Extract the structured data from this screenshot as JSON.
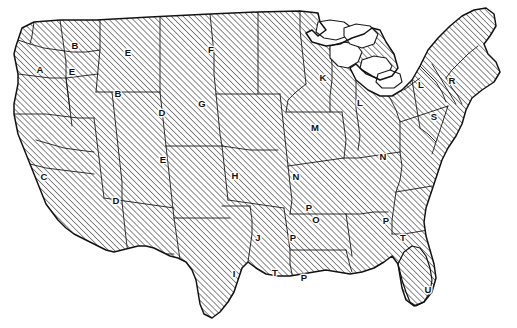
{
  "figure": {
    "width": 517,
    "height": 328,
    "background_color": "#ffffff",
    "line_color": "#1a1a1a",
    "hatch_color": "#2b2b2b",
    "hatch_angle_degrees": 45,
    "hatch_spacing_px": 3,
    "lakes_fill": "#ffffff"
  },
  "labels": [
    {
      "text": "A",
      "x": 40,
      "y": 70
    },
    {
      "text": "B",
      "x": 75,
      "y": 46
    },
    {
      "text": "E",
      "x": 72,
      "y": 72
    },
    {
      "text": "E",
      "x": 128,
      "y": 53
    },
    {
      "text": "B",
      "x": 118,
      "y": 94
    },
    {
      "text": "F",
      "x": 211,
      "y": 50
    },
    {
      "text": "D",
      "x": 162,
      "y": 113
    },
    {
      "text": "G",
      "x": 202,
      "y": 104
    },
    {
      "text": "C",
      "x": 44,
      "y": 177
    },
    {
      "text": "E",
      "x": 163,
      "y": 160
    },
    {
      "text": "D",
      "x": 116,
      "y": 201
    },
    {
      "text": "H",
      "x": 235,
      "y": 176
    },
    {
      "text": "K",
      "x": 323,
      "y": 78
    },
    {
      "text": "L",
      "x": 360,
      "y": 103
    },
    {
      "text": "M",
      "x": 315,
      "y": 128
    },
    {
      "text": "L",
      "x": 421,
      "y": 85
    },
    {
      "text": "R",
      "x": 452,
      "y": 81
    },
    {
      "text": "S",
      "x": 434,
      "y": 117
    },
    {
      "text": "N",
      "x": 383,
      "y": 157
    },
    {
      "text": "N",
      "x": 296,
      "y": 177
    },
    {
      "text": "J",
      "x": 258,
      "y": 238
    },
    {
      "text": "P",
      "x": 293,
      "y": 238
    },
    {
      "text": "P",
      "x": 309,
      "y": 208
    },
    {
      "text": "O",
      "x": 316,
      "y": 220
    },
    {
      "text": "I",
      "x": 234,
      "y": 274
    },
    {
      "text": "T",
      "x": 275,
      "y": 273
    },
    {
      "text": "P",
      "x": 304,
      "y": 278
    },
    {
      "text": "P",
      "x": 386,
      "y": 221
    },
    {
      "text": "T",
      "x": 403,
      "y": 238
    },
    {
      "text": "U",
      "x": 428,
      "y": 290
    }
  ],
  "geometry": {
    "nation_outline": "M 18 40 L 22 28 L 34 22 L 60 20 L 96 20 L 150 17 L 210 14 L 258 12 L 300 11 L 318 13 L 320 22 L 326 30 L 318 36 L 312 30 L 306 33 L 312 42 L 326 46 L 340 44 L 352 38 L 364 34 L 372 28 L 380 30 L 386 42 L 394 54 L 398 68 L 392 76 L 380 80 L 372 76 L 362 70 L 356 64 L 350 68 L 356 80 L 368 90 L 380 96 L 392 96 L 402 90 L 412 80 L 420 66 L 428 50 L 438 38 L 450 26 L 462 16 L 474 10 L 486 8 L 494 14 L 496 26 L 490 36 L 484 44 L 488 54 L 496 62 L 500 72 L 494 82 L 482 90 L 472 98 L 466 110 L 462 124 L 456 136 L 448 148 L 442 160 L 438 172 L 434 184 L 430 196 L 426 208 L 424 222 L 426 236 L 430 250 L 434 264 L 436 278 L 432 292 L 424 302 L 414 306 L 406 300 L 402 288 L 400 276 L 398 264 L 392 256 L 384 262 L 374 268 L 362 272 L 350 274 L 338 272 L 326 270 L 314 272 L 302 274 L 290 276 L 278 276 L 266 274 L 256 268 L 248 262 L 242 268 L 238 280 L 234 292 L 228 302 L 220 312 L 212 318 L 204 314 L 200 304 L 198 292 L 196 280 L 192 270 L 186 262 L 178 258 L 170 256 L 162 252 L 154 248 L 146 246 L 138 246 L 130 248 L 122 250 L 114 252 L 106 250 L 98 246 L 90 242 L 82 238 L 74 234 L 66 228 L 58 220 L 52 212 L 46 204 L 42 194 L 38 184 L 34 174 L 30 164 L 26 154 L 22 144 L 18 134 L 16 124 L 14 114 L 14 104 L 16 94 L 18 84 L 18 74 L 16 64 L 14 54 L 16 46 Z",
    "florida_outline": "M 398 264 L 404 252 L 412 246 L 420 248 L 426 256 L 430 268 L 432 280 L 430 292 L 424 302 L 416 306 L 410 302 L 406 292 L 402 280 Z",
    "lakes": [
      "M 318 22 L 330 20 L 344 22 L 352 28 L 348 36 L 336 40 L 324 38 L 316 32 Z",
      "M 330 46 L 344 42 L 356 44 L 362 52 L 358 62 L 348 68 L 338 66 L 330 58 Z",
      "M 344 28 L 356 24 L 370 26 L 378 34 L 374 44 L 362 48 L 350 44 L 344 36 Z",
      "M 362 60 L 374 56 L 386 58 L 392 66 L 388 74 L 376 78 L 366 74 L 360 68 Z",
      "M 378 74 L 390 70 L 400 74 L 402 82 L 394 88 L 382 88 L 376 82 Z"
    ],
    "state_borders": [
      "M 18 40 L 30 44 L 44 48 L 58 50 L 72 52 L 86 52 L 100 50",
      "M 100 20 L 100 50 L 98 70 L 96 92",
      "M 60 20 L 62 34 L 64 48 L 66 62",
      "M 18 74 L 34 76 L 50 78 L 66 78 L 82 76 L 98 74",
      "M 96 92 L 112 92 L 128 92 L 144 92 L 160 92",
      "M 66 62 L 66 78 L 68 94 L 70 110 L 72 126",
      "M 14 114 L 30 114 L 46 114 L 62 116 L 78 118 L 94 118",
      "M 94 118 L 96 134 L 98 150 L 100 166 L 102 182 L 104 198",
      "M 36 140 L 50 144 L 64 148 L 78 150 L 94 152",
      "M 30 164 L 46 168 L 62 170 L 78 172 L 94 174",
      "M 104 198 L 118 200 L 132 202 L 146 204 L 160 206 L 174 208",
      "M 160 17 L 160 34 L 160 52 L 160 72 L 160 92",
      "M 160 92 L 162 110 L 164 128 L 166 146",
      "M 112 92 L 114 110 L 116 128 L 118 146 L 120 164 L 122 182 L 122 202",
      "M 122 202 L 124 220 L 126 238 L 128 254",
      "M 166 146 L 180 146 L 194 146 L 208 146 L 222 146",
      "M 166 146 L 168 164 L 170 182 L 172 200 L 174 218",
      "M 210 14 L 212 34 L 214 54 L 214 74 L 216 94",
      "M 216 94 L 218 114 L 220 134 L 222 146",
      "M 216 94 L 232 94 L 248 94 L 264 94 L 280 94",
      "M 258 12 L 258 34 L 258 56 L 258 76 L 258 94",
      "M 222 146 L 224 164 L 226 182 L 228 200",
      "M 174 218 L 188 218 L 202 218 L 216 218 L 230 218",
      "M 222 146 L 236 148 L 250 150 L 264 150 L 278 150",
      "M 228 200 L 242 202 L 256 204 L 270 206 L 284 208",
      "M 280 94 L 282 112 L 284 130 L 286 148 L 288 166",
      "M 288 166 L 290 184 L 292 200 L 290 214",
      "M 288 166 L 302 164 L 316 162 L 330 160 L 344 158",
      "M 300 11 L 300 30 L 302 48 L 304 66 L 306 84",
      "M 306 84 L 296 92 L 288 100 L 286 112",
      "M 286 112 L 300 112 L 314 112 L 328 112 L 342 112",
      "M 330 48 L 332 64 L 332 80 L 330 96 L 330 112",
      "M 342 112 L 344 126 L 346 140 L 344 158",
      "M 344 158 L 358 158 L 372 156 L 386 154 L 400 152",
      "M 356 80 L 356 94 L 356 108 L 358 122 L 360 136 L 358 150",
      "M 400 152 L 402 166 L 400 180 L 396 192",
      "M 382 88 L 390 98 L 396 110 L 400 122 L 400 138 L 400 152",
      "M 400 122 L 412 118 L 424 114 L 436 110 L 448 106",
      "M 412 80 L 414 92 L 416 104 L 418 116 L 420 128",
      "M 432 64 L 438 74 L 444 84 L 450 94 L 456 104",
      "M 448 106 L 444 118 L 440 130 L 436 142 L 432 154",
      "M 420 128 L 428 134 L 436 142",
      "M 396 192 L 408 190 L 420 188 L 432 186",
      "M 396 192 L 394 206 L 392 220 L 392 234",
      "M 392 234 L 404 234 L 416 232 L 428 230",
      "M 290 214 L 304 214 L 318 214 L 332 214 L 346 214",
      "M 346 214 L 348 228 L 350 242 L 352 256",
      "M 346 214 L 360 214 L 374 212 L 388 212",
      "M 284 208 L 286 222 L 288 236 L 290 250 L 290 264",
      "M 290 250 L 304 250 L 318 250 L 332 250 L 346 250",
      "M 346 250 L 348 258 L 350 266 L 352 272",
      "M 248 262 L 250 248 L 252 234 L 252 220 L 250 206",
      "M 250 206 L 236 206 L 222 206",
      "M 290 264 L 292 274 L 292 276",
      "M 478 46 L 468 54 L 460 62 L 452 70 L 446 78",
      "M 446 78 L 452 88 L 458 96 L 462 104",
      "M 420 66 L 428 74 L 436 82 L 442 92 L 446 102",
      "M 404 90 L 412 84 L 420 78",
      "M 66 78 L 68 94 L 70 110",
      "M 128 254 L 140 254 L 152 254 L 164 254 L 174 254",
      "M 174 218 L 176 232 L 178 246 L 180 260",
      "M 34 22 L 32 36 L 30 44"
    ]
  }
}
